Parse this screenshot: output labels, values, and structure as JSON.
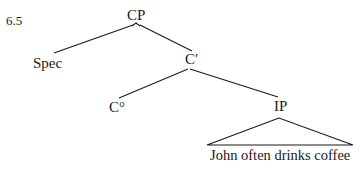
{
  "figure": {
    "number": "6.5"
  },
  "tree": {
    "nodes": {
      "cp": "CP",
      "spec": "Spec",
      "cbar": "C′",
      "c0": "C°",
      "ip": "IP",
      "ip_content": "John often drinks coffee"
    },
    "edges": [
      [
        "CP",
        "Spec"
      ],
      [
        "CP",
        "C′"
      ],
      [
        "C′",
        "C°"
      ],
      [
        "C′",
        "IP"
      ],
      [
        "IP",
        "John often drinks coffee (triangle)"
      ]
    ]
  },
  "colors": {
    "ink": "#1a1a1a",
    "background": "#ffffff"
  }
}
